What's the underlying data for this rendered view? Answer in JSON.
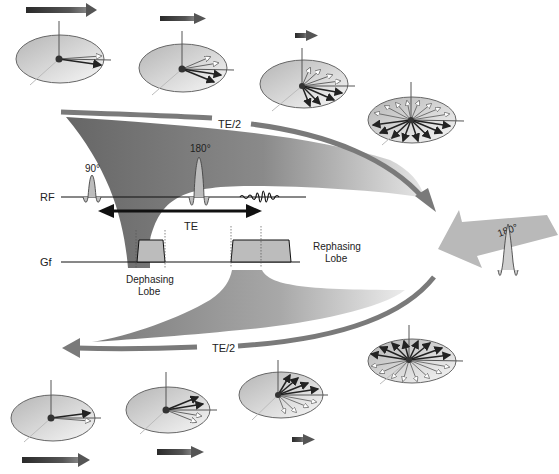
{
  "diagram": {
    "type": "mri-spin-echo-phase-diagram",
    "colors": {
      "dark_band": "#6e6e6e",
      "band_light": "#d8d8d8",
      "arc_arrow": "#7a7a7a",
      "big_arrow": "#b9b9b9",
      "disk_fill_dark": "#bdbdbd",
      "disk_fill_light": "#f2f2f2",
      "pulse_fill": "#bcbcbc",
      "line": "#111111"
    },
    "labels": {
      "te_half_top": "TE/2",
      "te_half_bottom": "TE/2",
      "rf": "RF",
      "gf": "Gf",
      "pulse_90": "90°",
      "pulse_180": "180°",
      "te": "TE",
      "dephasing_line1": "Dephasing",
      "dephasing_line2": "Lobe",
      "rephasing_line1": "Rephasing",
      "rephasing_line2": "Lobe",
      "big_arrow_180": "180°"
    },
    "top_row_spin_disks": [
      {
        "stage": 1,
        "spread": "minimal",
        "net_vector": "large"
      },
      {
        "stage": 2,
        "spread": "small",
        "net_vector": "medium"
      },
      {
        "stage": 3,
        "spread": "wide",
        "net_vector": "small"
      },
      {
        "stage": 4,
        "spread": "full",
        "net_vector": "none"
      }
    ],
    "bottom_row_spin_disks": [
      {
        "stage": 4,
        "spread": "full",
        "net_vector": "none"
      },
      {
        "stage": 3,
        "spread": "wide",
        "net_vector": "small"
      },
      {
        "stage": 2,
        "spread": "small",
        "net_vector": "medium"
      },
      {
        "stage": 1,
        "spread": "minimal",
        "net_vector": "large"
      }
    ]
  }
}
